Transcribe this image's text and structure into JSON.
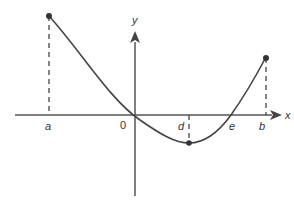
{
  "diagram": {
    "type": "function-graph",
    "axes": {
      "x_label": "x",
      "y_label": "y",
      "origin_label": "0"
    },
    "points": {
      "a": {
        "label": "a",
        "description": "left endpoint, curve maximum"
      },
      "d": {
        "label": "d",
        "description": "local minimum below x-axis"
      },
      "e": {
        "label": "e",
        "description": "x-intercept"
      },
      "b": {
        "label": "b",
        "description": "right endpoint"
      }
    },
    "colors": {
      "curve": "#444444",
      "axis": "#555555",
      "dashed": "#444444"
    }
  }
}
